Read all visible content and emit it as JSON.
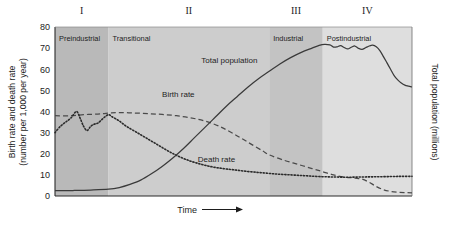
{
  "chart_data": {
    "type": "line",
    "title": "",
    "subtitle": "",
    "xlabel": "Time",
    "ylabel": "Birth rate and death rate (number per 1,000 per year)",
    "ylabel_line1": "Birth rate and death rate",
    "ylabel_line2": "(number per 1,000 per year)",
    "y2label": "Total population (millions)",
    "xlim": [
      0,
      100
    ],
    "ylim": [
      0,
      80
    ],
    "yticks": [
      0,
      10,
      20,
      30,
      40,
      50,
      60,
      70,
      80
    ],
    "xticks": [],
    "xtick_labels": [],
    "grid": false,
    "legend_position": "inline-annotations",
    "x_axis_arrow": true,
    "stages": [
      {
        "numeral": "I",
        "name": "Preindustrial",
        "x_start": 0,
        "x_end": 15,
        "band_color": "#b9b9b9"
      },
      {
        "numeral": "II",
        "name": "Transitional",
        "x_start": 15,
        "x_end": 60,
        "band_color": "#cdcdcd"
      },
      {
        "numeral": "III",
        "name": "Industrial",
        "x_start": 60,
        "x_end": 75,
        "band_color": "#c3c3c3"
      },
      {
        "numeral": "IV",
        "name": "Postindustrial",
        "x_start": 75,
        "x_end": 100,
        "band_color": "#dedede"
      }
    ],
    "series": [
      {
        "name": "Birth rate",
        "label": "Birth rate",
        "style": "dashed",
        "color": "#4a4a4a",
        "axis": "left",
        "label_x": 30,
        "label_y": 47,
        "points": [
          [
            0,
            38
          ],
          [
            4,
            38
          ],
          [
            8,
            38.5
          ],
          [
            12,
            38.8
          ],
          [
            15,
            39.2
          ],
          [
            18,
            39.5
          ],
          [
            22,
            39.3
          ],
          [
            26,
            39.0
          ],
          [
            30,
            38.6
          ],
          [
            34,
            38.0
          ],
          [
            38,
            37.0
          ],
          [
            42,
            35.5
          ],
          [
            46,
            33.0
          ],
          [
            50,
            29.5
          ],
          [
            54,
            25.5
          ],
          [
            58,
            21.5
          ],
          [
            60,
            19.5
          ],
          [
            64,
            17.0
          ],
          [
            68,
            15.0
          ],
          [
            72,
            13.0
          ],
          [
            75,
            11.5
          ],
          [
            78,
            10.0
          ],
          [
            81,
            9.0
          ],
          [
            84,
            8.5
          ],
          [
            86,
            8.0
          ],
          [
            88,
            6.5
          ],
          [
            90,
            4.5
          ],
          [
            92,
            3.0
          ],
          [
            94,
            2.2
          ],
          [
            96,
            1.8
          ],
          [
            98,
            1.6
          ],
          [
            100,
            1.5
          ]
        ]
      },
      {
        "name": "Death rate",
        "label": "Death rate",
        "style": "dotted",
        "color": "#2b2b2b",
        "axis": "left",
        "label_x": 40,
        "label_y": 16,
        "points": [
          [
            0,
            30
          ],
          [
            1.5,
            33
          ],
          [
            3,
            35
          ],
          [
            4.5,
            37
          ],
          [
            6,
            40
          ],
          [
            7,
            37
          ],
          [
            8,
            33
          ],
          [
            9,
            31
          ],
          [
            10,
            33
          ],
          [
            11,
            34
          ],
          [
            12,
            34.5
          ],
          [
            13,
            36
          ],
          [
            14,
            37.5
          ],
          [
            15,
            38.5
          ],
          [
            16,
            37.5
          ],
          [
            18,
            35.5
          ],
          [
            20,
            33
          ],
          [
            23,
            30
          ],
          [
            26,
            27
          ],
          [
            29,
            24
          ],
          [
            32,
            21
          ],
          [
            35,
            18.5
          ],
          [
            38,
            16.5
          ],
          [
            41,
            15
          ],
          [
            44,
            13.8
          ],
          [
            47,
            13.0
          ],
          [
            50,
            12.4
          ],
          [
            54,
            11.6
          ],
          [
            58,
            11.0
          ],
          [
            62,
            10.4
          ],
          [
            66,
            10.0
          ],
          [
            70,
            9.6
          ],
          [
            74,
            9.2
          ],
          [
            78,
            9.0
          ],
          [
            82,
            8.9
          ],
          [
            86,
            9.0
          ],
          [
            90,
            9.1
          ],
          [
            94,
            9.2
          ],
          [
            97,
            9.3
          ],
          [
            100,
            9.3
          ]
        ]
      },
      {
        "name": "Total population",
        "label": "Total population",
        "style": "solid",
        "color": "#3a3a3a",
        "axis": "right",
        "label_x": 41,
        "label_y": 63,
        "points": [
          [
            0,
            2.5
          ],
          [
            5,
            2.6
          ],
          [
            10,
            2.8
          ],
          [
            15,
            3.2
          ],
          [
            18,
            4.0
          ],
          [
            21,
            5.5
          ],
          [
            24,
            7.5
          ],
          [
            27,
            10.5
          ],
          [
            30,
            14.0
          ],
          [
            33,
            18.0
          ],
          [
            36,
            22.5
          ],
          [
            39,
            27.5
          ],
          [
            42,
            32.5
          ],
          [
            45,
            37.5
          ],
          [
            48,
            42.5
          ],
          [
            51,
            47.0
          ],
          [
            54,
            51.5
          ],
          [
            57,
            55.5
          ],
          [
            60,
            59.0
          ],
          [
            63,
            62.5
          ],
          [
            66,
            65.5
          ],
          [
            69,
            68.0
          ],
          [
            72,
            70.0
          ],
          [
            74,
            71.3
          ],
          [
            75.5,
            71.8
          ],
          [
            77,
            71.5
          ],
          [
            78,
            70.5
          ],
          [
            79,
            70.6
          ],
          [
            80,
            71.2
          ],
          [
            81,
            70.3
          ],
          [
            82,
            69.6
          ],
          [
            83,
            70.4
          ],
          [
            84,
            71.0
          ],
          [
            85,
            69.9
          ],
          [
            86,
            69.4
          ],
          [
            87,
            70.2
          ],
          [
            88,
            71.0
          ],
          [
            89,
            71.4
          ],
          [
            90,
            70.6
          ],
          [
            91,
            68.8
          ],
          [
            92,
            66.0
          ],
          [
            93,
            63.0
          ],
          [
            94,
            60.0
          ],
          [
            95,
            57.0
          ],
          [
            96,
            55.0
          ],
          [
            97,
            53.5
          ],
          [
            98,
            52.5
          ],
          [
            99,
            52.0
          ],
          [
            100,
            51.6
          ]
        ]
      }
    ]
  }
}
